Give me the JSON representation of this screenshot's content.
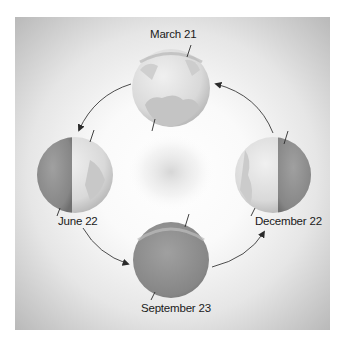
{
  "diagram": {
    "type": "earth-orbit-seasons",
    "labels": {
      "top": "March 21",
      "left": "June 22",
      "right": "December 22",
      "bottom": "September 23"
    },
    "globes": [
      {
        "id": "march-21",
        "position": "top",
        "illumination": "mostly-lit"
      },
      {
        "id": "june-22",
        "position": "left",
        "illumination": "right-half-lit"
      },
      {
        "id": "december-22",
        "position": "right",
        "illumination": "left-half-lit"
      },
      {
        "id": "september-23",
        "position": "bottom",
        "illumination": "mostly-dark"
      }
    ],
    "orbit_direction": "counterclockwise",
    "colors": {
      "frame_edge": "#b9b9b9",
      "center_glow": "#d8d8d8",
      "globe_light": "#e4e4e4",
      "globe_dark": "#8c8c8c",
      "arrow": "#3a3a3a"
    }
  }
}
